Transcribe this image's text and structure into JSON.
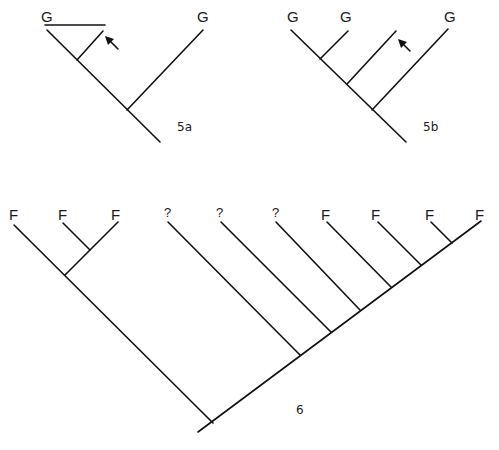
{
  "figures": [
    {
      "id": "5a",
      "caption": "5a",
      "taxa": [
        "G",
        "G"
      ],
      "arrow": "points to the unlabeled branch joined by horizontal bar to G",
      "newick": "((G,unlabeled),G)"
    },
    {
      "id": "5b",
      "caption": "5b",
      "taxa": [
        "G",
        "G",
        "G"
      ],
      "arrow": "points to the unlabeled third terminal branch",
      "newick": "(((G,G),unlabeled),G)"
    },
    {
      "id": "6",
      "caption": "6",
      "taxa": [
        "F",
        "F",
        "F",
        "?",
        "?",
        "?",
        "F",
        "F",
        "F",
        "F"
      ],
      "newick": "((F,(F,F)),(?,(?,(?,(F,(F,(F,F)))))))"
    }
  ],
  "colors": {
    "line": "#111111",
    "background": "#ffffff"
  }
}
